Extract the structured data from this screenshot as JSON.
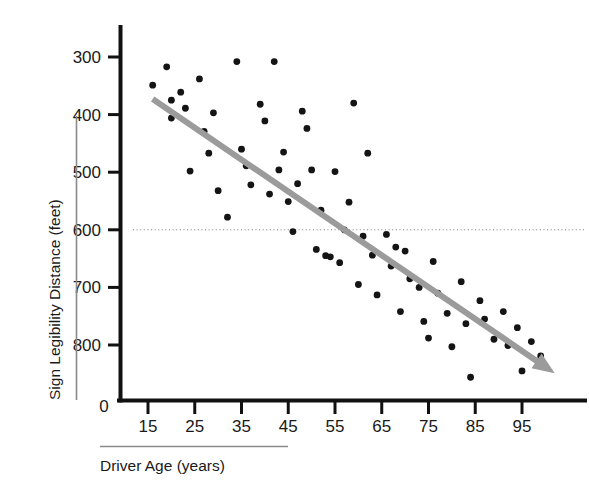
{
  "chart_data": {
    "type": "scatter",
    "title": "",
    "xlabel": "Driver Age (years)",
    "ylabel": "Sign Legibility Distance (feet)",
    "xlim": [
      10,
      105
    ],
    "ylim": [
      0,
      850
    ],
    "x_ticks": [
      15,
      25,
      35,
      45,
      55,
      65,
      75,
      85,
      95
    ],
    "y_ticks": [
      0,
      300,
      400,
      500,
      600,
      700,
      800
    ],
    "x_tick_labels": [
      "15",
      "25",
      "35",
      "45",
      "55",
      "65",
      "75",
      "85",
      "95"
    ],
    "y_tick_labels": [
      "800",
      "700",
      "600",
      "500",
      "400",
      "300",
      "0"
    ],
    "grid": false,
    "legend": null,
    "reference_line": {
      "orientation": "horizontal",
      "value": 500,
      "style": "dotted",
      "color": "#7d7d7d"
    },
    "trend_line": {
      "style": "solid-arrow",
      "color": "#9b9b9b",
      "x_start": 16,
      "y_start": 727,
      "x_end": 102,
      "y_end": 251
    },
    "points": [
      {
        "x": 16,
        "y": 751
      },
      {
        "x": 19,
        "y": 783
      },
      {
        "x": 20,
        "y": 725
      },
      {
        "x": 20,
        "y": 694
      },
      {
        "x": 22,
        "y": 739
      },
      {
        "x": 23,
        "y": 711
      },
      {
        "x": 24,
        "y": 602
      },
      {
        "x": 26,
        "y": 762
      },
      {
        "x": 27,
        "y": 671
      },
      {
        "x": 28,
        "y": 633
      },
      {
        "x": 29,
        "y": 703
      },
      {
        "x": 30,
        "y": 568
      },
      {
        "x": 32,
        "y": 522
      },
      {
        "x": 34,
        "y": 792
      },
      {
        "x": 35,
        "y": 640
      },
      {
        "x": 36,
        "y": 611
      },
      {
        "x": 37,
        "y": 578
      },
      {
        "x": 39,
        "y": 718
      },
      {
        "x": 40,
        "y": 689
      },
      {
        "x": 41,
        "y": 562
      },
      {
        "x": 42,
        "y": 792
      },
      {
        "x": 43,
        "y": 604
      },
      {
        "x": 44,
        "y": 635
      },
      {
        "x": 45,
        "y": 549
      },
      {
        "x": 46,
        "y": 497
      },
      {
        "x": 47,
        "y": 580
      },
      {
        "x": 48,
        "y": 706
      },
      {
        "x": 49,
        "y": 676
      },
      {
        "x": 50,
        "y": 604
      },
      {
        "x": 51,
        "y": 466
      },
      {
        "x": 52,
        "y": 534
      },
      {
        "x": 53,
        "y": 455
      },
      {
        "x": 54,
        "y": 453
      },
      {
        "x": 55,
        "y": 601
      },
      {
        "x": 56,
        "y": 443
      },
      {
        "x": 57,
        "y": 500
      },
      {
        "x": 58,
        "y": 548
      },
      {
        "x": 59,
        "y": 720
      },
      {
        "x": 60,
        "y": 405
      },
      {
        "x": 61,
        "y": 489
      },
      {
        "x": 62,
        "y": 633
      },
      {
        "x": 63,
        "y": 456
      },
      {
        "x": 64,
        "y": 387
      },
      {
        "x": 66,
        "y": 492
      },
      {
        "x": 67,
        "y": 437
      },
      {
        "x": 68,
        "y": 470
      },
      {
        "x": 69,
        "y": 358
      },
      {
        "x": 70,
        "y": 463
      },
      {
        "x": 71,
        "y": 415
      },
      {
        "x": 73,
        "y": 400
      },
      {
        "x": 74,
        "y": 341
      },
      {
        "x": 75,
        "y": 312
      },
      {
        "x": 76,
        "y": 445
      },
      {
        "x": 77,
        "y": 390
      },
      {
        "x": 79,
        "y": 355
      },
      {
        "x": 80,
        "y": 297
      },
      {
        "x": 82,
        "y": 410
      },
      {
        "x": 83,
        "y": 337
      },
      {
        "x": 84,
        "y": 244
      },
      {
        "x": 86,
        "y": 377
      },
      {
        "x": 87,
        "y": 345
      },
      {
        "x": 89,
        "y": 310
      },
      {
        "x": 91,
        "y": 358
      },
      {
        "x": 92,
        "y": 299
      },
      {
        "x": 94,
        "y": 330
      },
      {
        "x": 95,
        "y": 255
      },
      {
        "x": 97,
        "y": 306
      },
      {
        "x": 99,
        "y": 281
      }
    ]
  },
  "figure": {
    "y_axis_title": "Sign Legibility Distance (feet)",
    "x_axis_title": "Driver Age (years)",
    "origin_label": "0"
  }
}
